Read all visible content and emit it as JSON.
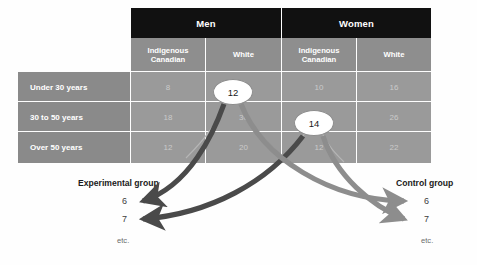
{
  "figure": {
    "background_color": "#fefefe",
    "arrow_left_color": "#4a4a4a",
    "arrow_right_color": "#8d8d8d"
  },
  "table": {
    "header_bg": "#111111",
    "subheader_bg": "#8e8e8e",
    "cell_bg": "#9a9a9a",
    "rowlabel_bg": "#8a8a8a",
    "groups": [
      {
        "label": "Men"
      },
      {
        "label": "Women"
      }
    ],
    "subheaders": [
      {
        "label": "Indigenous Canadian"
      },
      {
        "label": "White"
      },
      {
        "label": "Indigenous Canadian"
      },
      {
        "label": "White"
      }
    ],
    "rows": [
      {
        "label": "Under 30 years",
        "values": [
          "8",
          "12",
          "10",
          "16"
        ]
      },
      {
        "label": "30 to 50 years",
        "values": [
          "18",
          "30",
          "14",
          "26"
        ]
      },
      {
        "label": "Over 50 years",
        "values": [
          "12",
          "20",
          "12",
          "22"
        ]
      }
    ]
  },
  "callouts": [
    {
      "value": "12",
      "cell": "Men / White / Under 30 years"
    },
    {
      "value": "14",
      "cell": "Women / Indigenous Canadian / 30 to 50 years"
    }
  ],
  "groups_out": {
    "experimental": {
      "title": "Experimental group",
      "items": [
        "6",
        "7"
      ],
      "etc": "etc."
    },
    "control": {
      "title": "Control group",
      "items": [
        "6",
        "7"
      ],
      "etc": "etc."
    }
  }
}
